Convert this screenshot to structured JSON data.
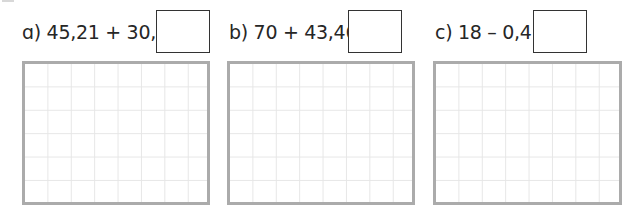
{
  "exercises": [
    {
      "id": "a",
      "label": "ɑ) 45,21 + 30,2 =",
      "prefix": "a)",
      "expression": "45,21 + 30,2 =",
      "answer": ""
    },
    {
      "id": "b",
      "label": "b) 70 + 43,46 =",
      "prefix": "b)",
      "expression": "70 + 43,46 =",
      "answer": ""
    },
    {
      "id": "c",
      "label": "c) 18 – 0,4 =",
      "prefix": "c)",
      "expression": "18 – 0,4 =",
      "answer": ""
    }
  ],
  "grid": {
    "columns": 8,
    "rows": 6,
    "border_color": "#ababab",
    "line_color": "#e6e6e6"
  }
}
